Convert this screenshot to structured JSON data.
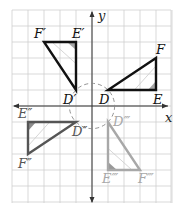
{
  "diagram": {
    "type": "coordinate-plane-rotations",
    "grid": {
      "xmin": -5,
      "xmax": 5,
      "ymin": -6,
      "ymax": 6,
      "unit_px": 16,
      "origin_px": [
        92,
        106
      ],
      "color": "#cfcfcf"
    },
    "axes": {
      "x_label": "x",
      "y_label": "y",
      "color": "#333333"
    },
    "circle": {
      "center": [
        0,
        0
      ],
      "radius": 1.414,
      "style": "dashed",
      "color": "#888888"
    },
    "triangles": [
      {
        "name": "DEF",
        "color": "#111111",
        "shade": "#888888",
        "vertices": {
          "D": [
            1,
            1
          ],
          "E": [
            4,
            1
          ],
          "F": [
            4,
            3
          ]
        },
        "labels": {
          "D": "D",
          "E": "E",
          "F": "F"
        }
      },
      {
        "name": "D'E'F'",
        "color": "#111111",
        "shade": "#888888",
        "vertices": {
          "D": [
            -1,
            1
          ],
          "E": [
            -1,
            4
          ],
          "F": [
            -3,
            4
          ]
        },
        "labels": {
          "D": "D′",
          "E": "E′",
          "F": "F′"
        }
      },
      {
        "name": "D''E''F''",
        "color": "#555555",
        "shade": "#666666",
        "vertices": {
          "D": [
            -1,
            -1
          ],
          "E": [
            -4,
            -1
          ],
          "F": [
            -4,
            -3
          ]
        },
        "labels": {
          "D": "D″",
          "E": "E″",
          "F": "F″"
        }
      },
      {
        "name": "D'''E'''F'''",
        "color": "#a8a8a8",
        "shade": "#777777",
        "vertices": {
          "D": [
            1,
            -1
          ],
          "E": [
            1,
            -4
          ],
          "F": [
            3,
            -4
          ]
        },
        "labels": {
          "D": "D‴",
          "E": "E‴",
          "F": "F‴"
        }
      }
    ]
  }
}
